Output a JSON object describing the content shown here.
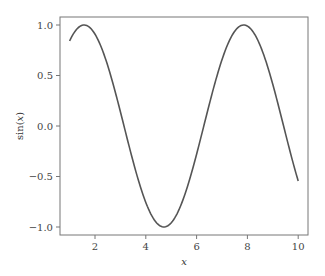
{
  "chart_data": {
    "type": "line",
    "title": "",
    "xlabel": "x",
    "ylabel": "sin(x)",
    "xlim": [
      0.6,
      10.4
    ],
    "ylim": [
      -1.09,
      1.09
    ],
    "xticks": [
      2,
      4,
      6,
      8,
      10
    ],
    "xtick_labels": [
      "2",
      "4",
      "6",
      "8",
      "10"
    ],
    "yticks": [
      1.0,
      0.5,
      0.0,
      -0.5,
      -1.0
    ],
    "ytick_labels": [
      "1.0",
      "0.5",
      "0.0",
      "−0.5",
      "−1.0"
    ],
    "grid": false,
    "legend": null,
    "series": [
      {
        "name": "sin(x)",
        "color": "#555555",
        "x": [
          1.0,
          1.5,
          2.0,
          2.5,
          3.0,
          3.5,
          4.0,
          4.5,
          5.0,
          5.5,
          6.0,
          6.5,
          7.0,
          7.5,
          8.0,
          8.5,
          9.0,
          9.5,
          10.0
        ],
        "y": [
          0.84,
          1.0,
          0.91,
          0.6,
          0.14,
          -0.35,
          -0.76,
          -0.98,
          -0.96,
          -0.71,
          -0.28,
          0.22,
          0.66,
          0.94,
          0.99,
          0.8,
          0.41,
          -0.08,
          -0.54
        ]
      }
    ]
  }
}
